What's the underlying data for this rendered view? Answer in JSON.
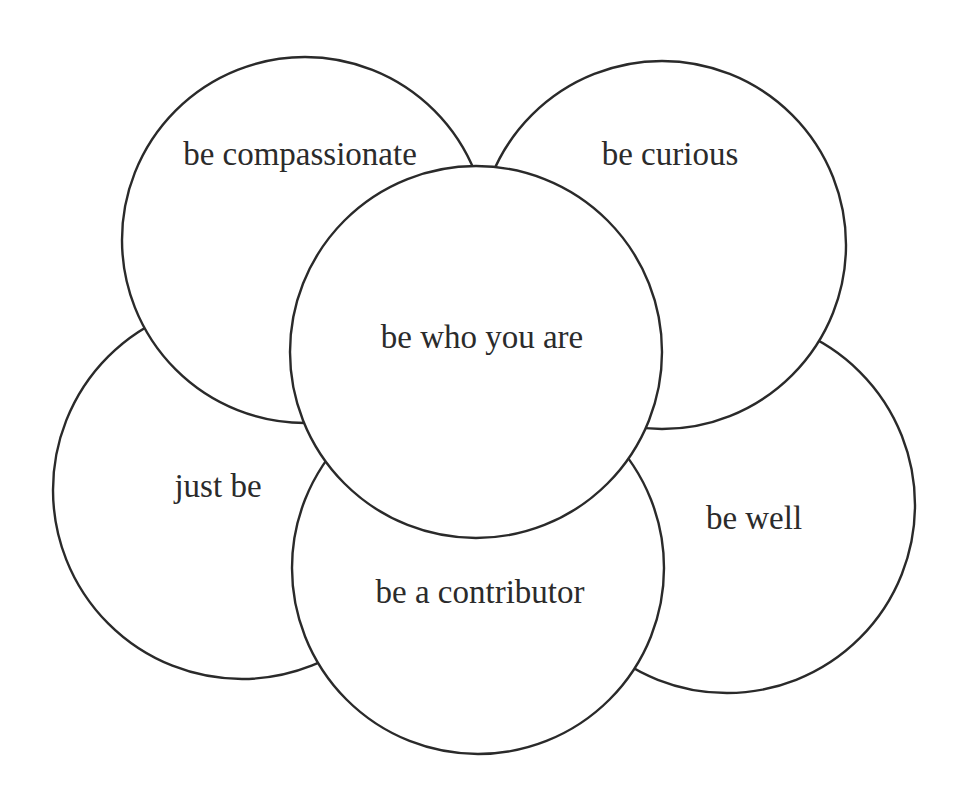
{
  "diagram": {
    "type": "overlapping-circles",
    "stroke_color": "#2a2a2a",
    "fill_color": "#ffffff",
    "background": "#ffffff",
    "circles": [
      {
        "id": "just-be",
        "label": "just be",
        "cx": 242,
        "cy": 490,
        "r": 189,
        "label_x": 218,
        "label_y": 497
      },
      {
        "id": "be-well",
        "label": "be well",
        "cx": 727,
        "cy": 505,
        "r": 188,
        "label_x": 754,
        "label_y": 529
      },
      {
        "id": "be-compassionate",
        "label": "be compassionate",
        "cx": 305,
        "cy": 240,
        "r": 183,
        "label_x": 300,
        "label_y": 165
      },
      {
        "id": "be-curious",
        "label": "be curious",
        "cx": 662,
        "cy": 245,
        "r": 184,
        "label_x": 670,
        "label_y": 165
      },
      {
        "id": "be-a-contributor",
        "label": "be a contributor",
        "cx": 478,
        "cy": 568,
        "r": 186,
        "label_x": 480,
        "label_y": 603
      },
      {
        "id": "be-who-you-are",
        "label": "be who you are",
        "cx": 476,
        "cy": 352,
        "r": 186,
        "label_x": 482,
        "label_y": 348
      }
    ]
  }
}
